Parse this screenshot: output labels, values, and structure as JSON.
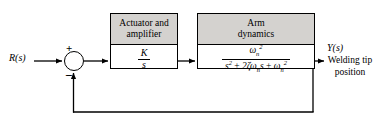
{
  "diagram": {
    "type": "control-system-block-diagram",
    "background_color": "#ffffff",
    "line_color": "#000000",
    "block_header_color": "#d4d2cf"
  },
  "input": {
    "label": "R(s)",
    "name": "reference-input"
  },
  "summing_junction": {
    "plus_sign": "+",
    "minus_sign": "−",
    "plus_input": "reference",
    "minus_input": "feedback"
  },
  "blocks": [
    {
      "id": "actuator",
      "title_line1": "Actuator and",
      "title_line2": "amplifier",
      "transfer_function": {
        "numerator": "K",
        "denominator": "s",
        "text": "K / s"
      }
    },
    {
      "id": "arm",
      "title_line1": "Arm",
      "title_line2": "dynamics",
      "transfer_function": {
        "numerator_base": "ω",
        "numerator_sub": "n",
        "numerator_sup": "2",
        "numerator_text": "ωₙ²",
        "denominator_text": "s² + 2ζωₙs + ωₙ²",
        "denominator_terms": [
          "s²",
          "2ζωₙs",
          "ωₙ²"
        ],
        "text": "ωₙ² / (s² + 2ζωₙs + ωₙ²)"
      }
    }
  ],
  "output": {
    "label": "Y(s)",
    "description_line1": "Welding tip",
    "description_line2": "position"
  },
  "feedback": {
    "type": "unity",
    "path": "output-to-summing-junction"
  }
}
